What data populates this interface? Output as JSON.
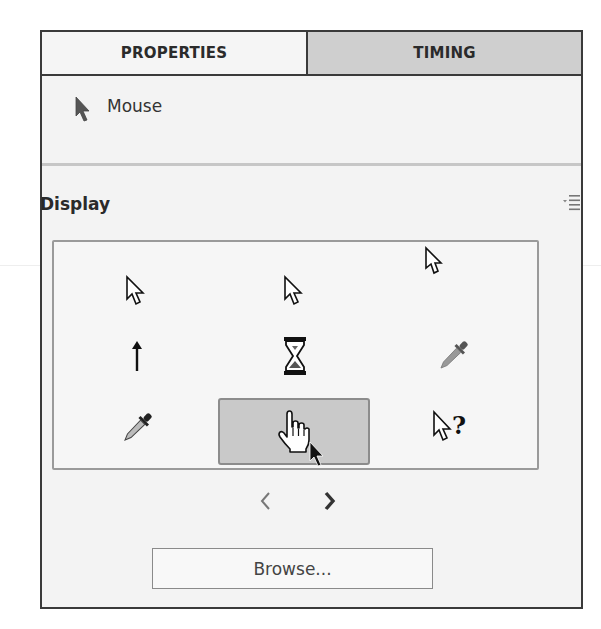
{
  "tabs": [
    {
      "label": "PROPERTIES",
      "active": true
    },
    {
      "label": "TIMING",
      "active": false
    }
  ],
  "object": {
    "icon": "mouse-pointer-icon",
    "label": "Mouse"
  },
  "display": {
    "heading": "Display",
    "menu_icon": "panel-menu-icon",
    "cursors": [
      {
        "name": "arrow-cursor",
        "row": 0,
        "col": 0,
        "selected": false
      },
      {
        "name": "arrow-cursor-alt",
        "row": 0,
        "col": 1,
        "selected": false
      },
      {
        "name": "none",
        "row": 0,
        "col": 2,
        "selected": false
      },
      {
        "name": "up-arrow-cursor",
        "row": 1,
        "col": 0,
        "selected": false
      },
      {
        "name": "hourglass-cursor",
        "row": 1,
        "col": 1,
        "selected": false
      },
      {
        "name": "eyedropper-cursor",
        "row": 1,
        "col": 2,
        "selected": false
      },
      {
        "name": "eyedropper-cursor-dark",
        "row": 2,
        "col": 0,
        "selected": false
      },
      {
        "name": "hand-pointer-cursor",
        "row": 2,
        "col": 1,
        "selected": true
      },
      {
        "name": "help-cursor",
        "row": 2,
        "col": 2,
        "selected": false
      }
    ],
    "pager": {
      "prev_icon": "chevron-left-icon",
      "next_icon": "chevron-right-icon",
      "prev_enabled": false,
      "next_enabled": true
    },
    "browse_label": "Browse..."
  },
  "colors": {
    "panel_bg": "#f3f3f3",
    "inactive_tab": "#cfcfcf",
    "border": "#3a3a3a",
    "selected_cell": "#c9c9c9"
  }
}
